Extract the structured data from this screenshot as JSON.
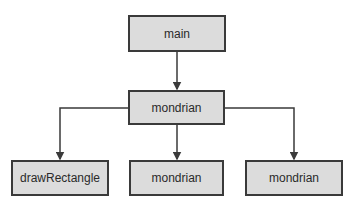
{
  "diagram": {
    "type": "call-tree",
    "colors": {
      "node_fill": "#dcdcdc",
      "node_border": "#3a3a3a",
      "edge": "#3a3a3a",
      "text": "#2a2a2a"
    },
    "nodes": [
      {
        "id": "main",
        "label": "main"
      },
      {
        "id": "mondrian_root",
        "label": "mondrian"
      },
      {
        "id": "drawRectangle",
        "label": "drawRectangle"
      },
      {
        "id": "mondrian_left",
        "label": "mondrian"
      },
      {
        "id": "mondrian_right",
        "label": "mondrian"
      }
    ],
    "edges": [
      {
        "from": "main",
        "to": "mondrian_root"
      },
      {
        "from": "mondrian_root",
        "to": "drawRectangle"
      },
      {
        "from": "mondrian_root",
        "to": "mondrian_left"
      },
      {
        "from": "mondrian_root",
        "to": "mondrian_right"
      }
    ]
  }
}
